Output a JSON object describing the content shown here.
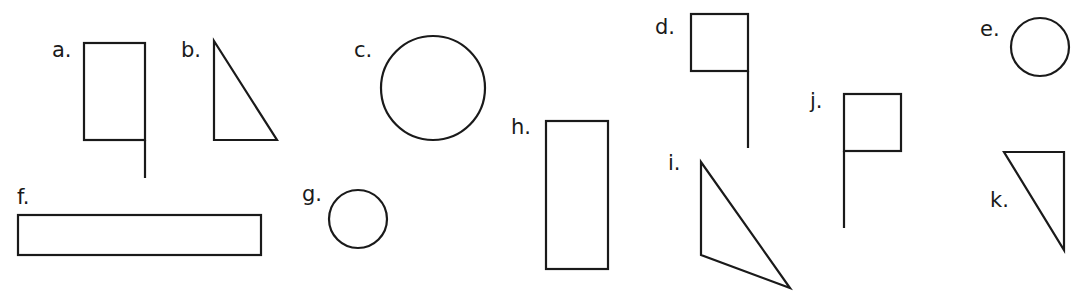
{
  "figure": {
    "stroke_color": "#1a1a1a",
    "background": "#ffffff",
    "shapes": [
      {
        "label": "a.",
        "kind": "flag-rectangle",
        "lx": 52,
        "ly": 57
      },
      {
        "label": "b.",
        "kind": "right-triangle",
        "lx": 181,
        "ly": 57
      },
      {
        "label": "c.",
        "kind": "circle-large",
        "lx": 354,
        "ly": 57
      },
      {
        "label": "d.",
        "kind": "flag-square",
        "lx": 655,
        "ly": 34
      },
      {
        "label": "e.",
        "kind": "circle-small",
        "lx": 980,
        "ly": 36
      },
      {
        "label": "f.",
        "kind": "long-rectangle",
        "lx": 17,
        "ly": 204
      },
      {
        "label": "g.",
        "kind": "circle-small",
        "lx": 302,
        "ly": 201
      },
      {
        "label": "h.",
        "kind": "tall-rectangle",
        "lx": 511,
        "ly": 134
      },
      {
        "label": "i.",
        "kind": "triangle",
        "lx": 668,
        "ly": 170
      },
      {
        "label": "j.",
        "kind": "flag-square",
        "lx": 810,
        "ly": 108
      },
      {
        "label": "k.",
        "kind": "right-triangle",
        "lx": 990,
        "ly": 207
      }
    ]
  }
}
